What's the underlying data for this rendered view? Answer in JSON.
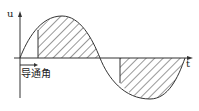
{
  "diagram": {
    "type": "waveform",
    "axes": {
      "y_label": "u",
      "x_label": "t"
    },
    "annotation": {
      "conduction_angle_label": "导通角"
    },
    "colors": {
      "line": "#333333",
      "hatch": "#333333",
      "background": "#ffffff"
    }
  }
}
